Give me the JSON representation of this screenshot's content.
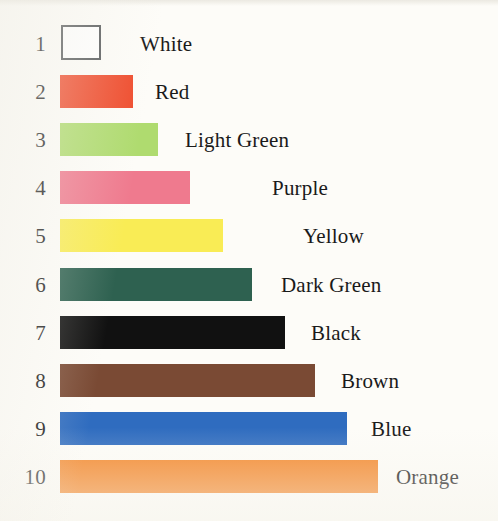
{
  "chart_data": {
    "type": "bar",
    "orientation": "horizontal",
    "title": "",
    "xlabel": "",
    "ylabel": "",
    "grid": false,
    "legend": "none",
    "categories": [
      "White",
      "Red",
      "Light Green",
      "Purple",
      "Yellow",
      "Dark Green",
      "Black",
      "Brown",
      "Blue",
      "Orange"
    ],
    "ranks": [
      "1",
      "2",
      "3",
      "4",
      "5",
      "6",
      "7",
      "8",
      "9",
      "10"
    ],
    "values": [
      40,
      73,
      98,
      130,
      163,
      192,
      225,
      255,
      287,
      318
    ],
    "value_unit": "px",
    "xlim": [
      0,
      330
    ],
    "bars": [
      {
        "rank": "1",
        "label": "White",
        "value": 40,
        "color": "#ffffff",
        "outline": "#55585a",
        "outlined": true,
        "bar_left": 61,
        "bar_width": 40,
        "label_left": 140
      },
      {
        "rank": "2",
        "label": "Red",
        "value": 73,
        "color": "#ef4b2c",
        "outline": "",
        "outlined": false,
        "bar_left": 60,
        "bar_width": 73,
        "label_left": 155
      },
      {
        "rank": "3",
        "label": "Light Green",
        "value": 98,
        "color": "#afdb6f",
        "outline": "",
        "outlined": false,
        "bar_left": 60,
        "bar_width": 98,
        "label_left": 185
      },
      {
        "rank": "4",
        "label": "Purple",
        "value": 130,
        "color": "#ef7a8e",
        "outline": "",
        "outlined": false,
        "bar_left": 60,
        "bar_width": 130,
        "label_left": 272
      },
      {
        "rank": "5",
        "label": "Yellow",
        "value": 163,
        "color": "#f9ec55",
        "outline": "",
        "outlined": false,
        "bar_left": 60,
        "bar_width": 163,
        "label_left": 303
      },
      {
        "rank": "6",
        "label": "Dark Green",
        "value": 192,
        "color": "#2e6150",
        "outline": "",
        "outlined": false,
        "bar_left": 60,
        "bar_width": 192,
        "label_left": 281
      },
      {
        "rank": "7",
        "label": "Black",
        "value": 225,
        "color": "#111111",
        "outline": "",
        "outlined": false,
        "bar_left": 60,
        "bar_width": 225,
        "label_left": 311
      },
      {
        "rank": "8",
        "label": "Brown",
        "value": 255,
        "color": "#7a4a34",
        "outline": "",
        "outlined": false,
        "bar_left": 60,
        "bar_width": 255,
        "label_left": 341
      },
      {
        "rank": "9",
        "label": "Blue",
        "value": 287,
        "color": "#2f6cbf",
        "outline": "",
        "outlined": false,
        "bar_left": 60,
        "bar_width": 287,
        "label_left": 371
      },
      {
        "rank": "10",
        "label": "Orange",
        "value": 318,
        "color": "#f3872b",
        "outline": "",
        "outlined": false,
        "bar_left": 60,
        "bar_width": 318,
        "label_left": 396
      }
    ],
    "row_tops": [
      24,
      72,
      120,
      168,
      216,
      265,
      313,
      361,
      409,
      457
    ],
    "colors": {
      "white": "#ffffff",
      "white_outline": "#55585a",
      "red": "#ef4b2c",
      "light_green": "#afdb6f",
      "purple": "#ef7a8e",
      "yellow": "#f9ec55",
      "dark_green": "#2e6150",
      "black": "#111111",
      "brown": "#7a4a34",
      "blue": "#2f6cbf",
      "orange": "#f3872b",
      "background": "#fdfcf8",
      "text": "#1a1a1a"
    }
  }
}
